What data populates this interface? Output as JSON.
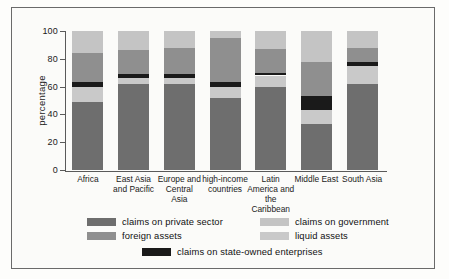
{
  "chart_data": {
    "type": "bar",
    "subtype": "stacked-bar-100",
    "title": "",
    "xlabel": "",
    "ylabel": "percentage",
    "ylim": [
      0,
      100
    ],
    "yticks": [
      0,
      20,
      40,
      60,
      80,
      100
    ],
    "ytick_labels": [
      "0",
      "20",
      "40",
      "60",
      "80",
      "100"
    ],
    "grid": false,
    "legend_position": "bottom",
    "stack_order_bottom_to_top": [
      "claims on private sector",
      "liquid assets",
      "claims on state-owned enterprises",
      "foreign assets",
      "claims on government"
    ],
    "categories": [
      "Africa",
      "East Asia and Pacific",
      "Europe and Central Asia",
      "high-income countries",
      "Latin America and the Caribbean",
      "Middle East",
      "South Asia"
    ],
    "series": [
      {
        "name": "claims on private sector",
        "color": "#6e6e6e",
        "values": [
          49,
          62,
          62,
          52,
          60,
          33,
          62
        ]
      },
      {
        "name": "liquid assets",
        "color": "#c9c9c9",
        "values": [
          11,
          4,
          4,
          8,
          8,
          10,
          13
        ]
      },
      {
        "name": "claims on state-owned enterprises",
        "color": "#1a1a1a",
        "values": [
          3,
          3,
          3,
          3,
          2,
          10,
          3
        ]
      },
      {
        "name": "foreign assets",
        "color": "#8f8f8f",
        "values": [
          21,
          17,
          19,
          32,
          17,
          25,
          10
        ]
      },
      {
        "name": "claims on government",
        "color": "#c4c4c4",
        "values": [
          16,
          14,
          12,
          5,
          13,
          22,
          12
        ]
      }
    ]
  },
  "legend": {
    "items": [
      {
        "label": "claims on private sector",
        "color": "#6e6e6e"
      },
      {
        "label": "claims on government",
        "color": "#c4c4c4"
      },
      {
        "label": "foreign assets",
        "color": "#8f8f8f"
      },
      {
        "label": "liquid assets",
        "color": "#c9c9c9"
      },
      {
        "label": "claims on state-owned enterprises",
        "color": "#1a1a1a"
      }
    ]
  },
  "axis": {
    "y_title": "percentage"
  }
}
